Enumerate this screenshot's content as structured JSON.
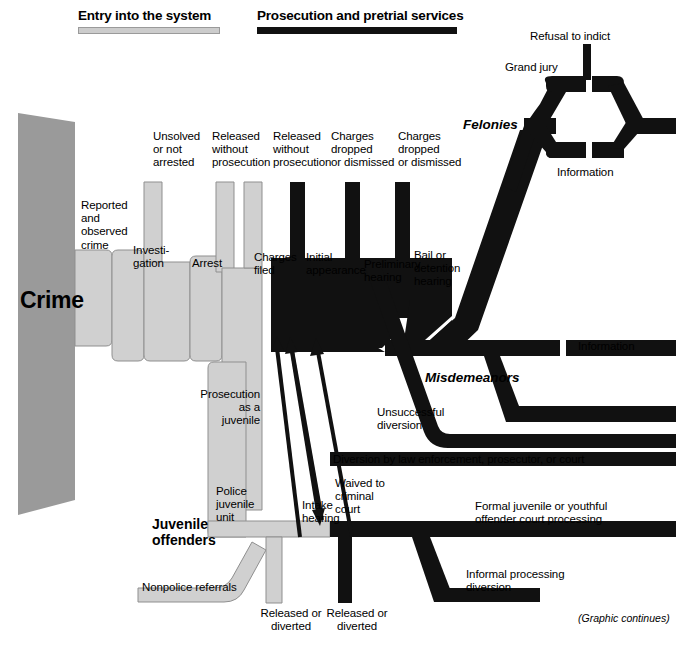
{
  "headers": [
    {
      "label": "Entry into the system",
      "bar_style": "light"
    },
    {
      "label": "Prosecution and pretrial services",
      "bar_style": "dark"
    }
  ],
  "colors": {
    "crime_block": "#9a9a9a",
    "entry_band": "#d0d0d0",
    "prosecution_band": "#111111",
    "juvenile_band": "#d0d0d0",
    "background": "#ffffff",
    "outline": "#6f6f6f"
  },
  "big_labels": {
    "crime": "Crime"
  },
  "stage_names": {
    "felonies": "Felonies",
    "misdemeanors": "Misdemeanors"
  },
  "juvenile_title": "Juvenile\noffenders",
  "exit_labels": [
    {
      "id": "unsolved-or-not-arrested",
      "text": "Unsolved\nor not\narrested"
    },
    {
      "id": "released-without-prosecution-1",
      "text": "Released\nwithout\nprosecution"
    },
    {
      "id": "released-without-prosecution-2",
      "text": "Released\nwithout\nprosecution"
    },
    {
      "id": "charges-dropped-or-dismissed-1",
      "text": "Charges\ndropped\nor dismissed"
    },
    {
      "id": "charges-dropped-or-dismissed-2",
      "text": "Charges\ndropped\nor dismissed"
    }
  ],
  "step_labels": [
    {
      "id": "reported-and-observed-crime",
      "text": "Reported\nand\nobserved\ncrime"
    },
    {
      "id": "investigation",
      "text": "Investi-\ngation"
    },
    {
      "id": "arrest",
      "text": "Arrest"
    },
    {
      "id": "charges-filed",
      "text": "Charges\nfiled"
    },
    {
      "id": "initial-appearance",
      "text": "Initial\nappearance"
    },
    {
      "id": "preliminary-hearing",
      "text": "Preliminary\nhearing"
    },
    {
      "id": "bail-or-detention-hearing",
      "text": "Bail or\ndetention\nhearing"
    },
    {
      "id": "grand-jury",
      "text": "Grand jury"
    },
    {
      "id": "refusal-to-indict",
      "text": "Refusal to indict"
    },
    {
      "id": "information-felony",
      "text": "Information"
    },
    {
      "id": "information-misdemeanor",
      "text": "Information"
    }
  ],
  "juvenile_labels": [
    {
      "id": "prosecution-as-a-juvenile",
      "text": "Prosecution\nas a\njuvenile"
    },
    {
      "id": "police-juvenile-unit",
      "text": "Police\njuvenile\nunit"
    },
    {
      "id": "intake-hearing",
      "text": "Intake\nhearing"
    },
    {
      "id": "nonpolice-referrals",
      "text": "Nonpolice referrals"
    },
    {
      "id": "released-or-diverted-1",
      "text": "Released or\ndiverted"
    },
    {
      "id": "released-or-diverted-2",
      "text": "Released or\ndiverted"
    },
    {
      "id": "waived-to-criminal-court",
      "text": "Waived to\ncriminal\ncourt"
    },
    {
      "id": "unsuccessful-diversion",
      "text": "Unsuccessful\ndiversion"
    },
    {
      "id": "diversion-by-law-enforcement",
      "text": "Diversion by law enforcement, prosecutor, or court"
    },
    {
      "id": "formal-juvenile-court-processing",
      "text": "Formal juvenile or youthful\noffender court processing"
    },
    {
      "id": "informal-processing-diversion",
      "text": "Informal processing\ndiversion"
    }
  ],
  "footer_note": "(Graphic continues)"
}
